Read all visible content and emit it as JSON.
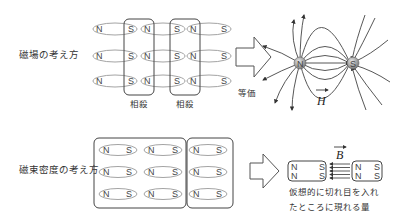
{
  "top": {
    "label": "磁場の考え方",
    "cancel_labels": [
      "相殺",
      "相殺"
    ],
    "equivalent_label": "等価",
    "magnet_rows": 3,
    "magnets_per_row": [
      [
        "N",
        "S"
      ],
      [
        "N",
        "S"
      ],
      [
        "N",
        "S"
      ]
    ],
    "pole_n": "N",
    "pole_s": "S",
    "field_vector": "H"
  },
  "bottom": {
    "label": "磁束密度の考え方",
    "magnets_per_row": [
      [
        "N",
        "S"
      ],
      [
        "N",
        "S"
      ],
      [
        "N",
        "S"
      ]
    ],
    "cut_left": {
      "top": [
        "N",
        "S"
      ],
      "bottom": [
        "N",
        "S"
      ]
    },
    "cut_right": {
      "top": [
        "N",
        "S"
      ],
      "bottom": [
        "N",
        "S"
      ]
    },
    "field_vector": "B",
    "caption_line1": "仮想的に切れ目を入れ",
    "caption_line2": "たところに現れる量"
  },
  "colors": {
    "line": "#555555",
    "ellipse": "#888888",
    "charge_fill": "#999999"
  }
}
